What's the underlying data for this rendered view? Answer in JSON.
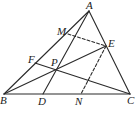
{
  "figure": {
    "type": "geometry",
    "stroke_color": "#2a2a2a",
    "points": {
      "A": {
        "label": "A",
        "x": 89,
        "y": 11
      },
      "B": {
        "label": "B",
        "x": 4,
        "y": 94
      },
      "C": {
        "label": "C",
        "x": 130,
        "y": 94
      },
      "D": {
        "label": "D",
        "x": 43,
        "y": 94
      },
      "N": {
        "label": "N",
        "x": 81,
        "y": 94
      },
      "E": {
        "label": "E",
        "x": 106,
        "y": 46
      },
      "M": {
        "label": "M",
        "x": 68,
        "y": 34
      },
      "F": {
        "label": "F",
        "x": 35,
        "y": 63
      },
      "P": {
        "label": "P",
        "x": 54,
        "y": 70
      }
    },
    "solid_segments": [
      "AB",
      "AC",
      "BC",
      "AD",
      "BE",
      "CF"
    ],
    "dashed_segments": [
      "ME",
      "EN"
    ]
  }
}
